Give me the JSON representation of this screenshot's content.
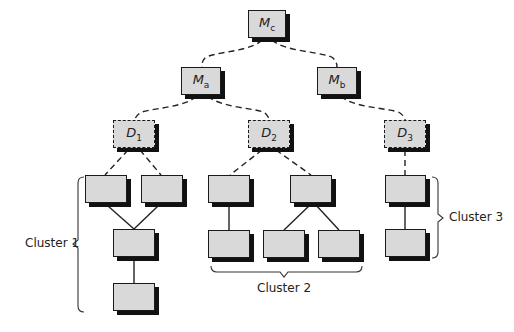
{
  "diagram": {
    "colors": {
      "node_fill": "#d9d9d9",
      "node_border": "#1a1a1a",
      "shadow": "#111111",
      "line": "#222222",
      "background": "#ffffff"
    },
    "nodes": [
      {
        "id": "Mc",
        "main": "M",
        "sub": "c",
        "style": "solid"
      },
      {
        "id": "Ma",
        "main": "M",
        "sub": "a",
        "style": "solid"
      },
      {
        "id": "Mb",
        "main": "M",
        "sub": "b",
        "style": "solid"
      },
      {
        "id": "D1",
        "main": "D",
        "sub": "1",
        "style": "dashed"
      },
      {
        "id": "D2",
        "main": "D",
        "sub": "2",
        "style": "dashed"
      },
      {
        "id": "D3",
        "main": "D",
        "sub": "3",
        "style": "dashed"
      }
    ],
    "edges_dashed": [
      [
        "Mc",
        "Ma"
      ],
      [
        "Mc",
        "Mb"
      ],
      [
        "Ma",
        "D1"
      ],
      [
        "Ma",
        "D2"
      ],
      [
        "Mb",
        "D3"
      ],
      [
        "D1",
        "c1a"
      ],
      [
        "D1",
        "c1b"
      ],
      [
        "D2",
        "c2a"
      ],
      [
        "D2",
        "c2b"
      ],
      [
        "D3",
        "c3a"
      ]
    ],
    "edges_solid": [
      [
        "c1a",
        "c1c"
      ],
      [
        "c1b",
        "c1c"
      ],
      [
        "c1c",
        "c1d"
      ],
      [
        "c2a",
        "c2c"
      ],
      [
        "c2b",
        "c2d"
      ],
      [
        "c2b",
        "c2e"
      ],
      [
        "c3a",
        "c3b"
      ]
    ],
    "clusters": [
      {
        "label": "Cluster 1",
        "members": [
          "c1a",
          "c1b",
          "c1c",
          "c1d"
        ]
      },
      {
        "label": "Cluster 2",
        "members": [
          "c2a",
          "c2b",
          "c2c",
          "c2d",
          "c2e"
        ]
      },
      {
        "label": "Cluster 3",
        "members": [
          "c3a",
          "c3b"
        ]
      }
    ]
  }
}
